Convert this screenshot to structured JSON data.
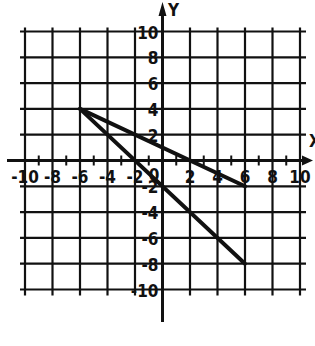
{
  "chart_data": {
    "type": "line",
    "title": "",
    "xlabel": "X",
    "ylabel": "Y",
    "xlim": [
      -10,
      10
    ],
    "ylim": [
      -10,
      10
    ],
    "grid": true,
    "grid_step": 2,
    "x_ticks": [
      -10,
      -8,
      -6,
      -4,
      -2,
      2,
      4,
      6,
      8,
      10
    ],
    "y_ticks": [
      10,
      8,
      6,
      4,
      2,
      -2,
      -4,
      -6,
      -8,
      -10
    ],
    "x_tick_labels": [
      "-10",
      "-8",
      "-6",
      "-4",
      "-2",
      "2",
      "4",
      "6",
      "8",
      "10"
    ],
    "y_tick_labels": [
      "10",
      "8",
      "6",
      "4",
      "2",
      "-2",
      "-4",
      "-6",
      "-8",
      "-10"
    ],
    "origin_label": "0",
    "series": [
      {
        "name": "segment-1",
        "points": [
          [
            -6,
            4
          ],
          [
            6,
            -2
          ]
        ]
      },
      {
        "name": "segment-2",
        "points": [
          [
            -6,
            4
          ],
          [
            6,
            -8
          ]
        ]
      }
    ]
  },
  "colors": {
    "ink": "#111111",
    "background": "#ffffff"
  }
}
